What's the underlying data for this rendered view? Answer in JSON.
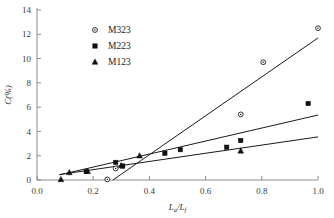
{
  "chart_data": {
    "type": "scatter",
    "title": "",
    "xlabel": "La/Lf",
    "xlabel_parts": {
      "base1": "L",
      "sub1": "a",
      "slash": "/",
      "base2": "L",
      "sub2": "f"
    },
    "ylabel": "C(%)",
    "xlim": [
      0.0,
      1.0
    ],
    "ylim": [
      0,
      14
    ],
    "xticks": [
      0.0,
      0.2,
      0.4,
      0.6,
      0.8,
      1.0
    ],
    "xtick_labels": [
      "0.0",
      "0.2",
      "0.4",
      "0.6",
      "0.8",
      "1.0"
    ],
    "yticks": [
      0,
      2,
      4,
      6,
      8,
      10,
      12,
      14
    ],
    "ytick_labels": [
      "0",
      "2",
      "4",
      "6",
      "8",
      "10",
      "12",
      "14"
    ],
    "grid": false,
    "legend_position": "upper-center-left",
    "series": [
      {
        "name": "M323",
        "marker": "open-circle",
        "color": "#111111",
        "points": [
          {
            "x": 0.25,
            "y": 0.05
          },
          {
            "x": 0.28,
            "y": 0.95
          },
          {
            "x": 0.725,
            "y": 5.4
          },
          {
            "x": 0.805,
            "y": 9.7
          },
          {
            "x": 1.0,
            "y": 12.5
          }
        ],
        "trendline": {
          "x1": 0.27,
          "y1": 0.0,
          "x2": 1.0,
          "y2": 11.7
        }
      },
      {
        "name": "M223",
        "marker": "filled-square",
        "color": "#111111",
        "points": [
          {
            "x": 0.175,
            "y": 0.7
          },
          {
            "x": 0.28,
            "y": 1.45
          },
          {
            "x": 0.305,
            "y": 1.15
          },
          {
            "x": 0.455,
            "y": 2.2
          },
          {
            "x": 0.51,
            "y": 2.5
          },
          {
            "x": 0.675,
            "y": 2.7
          },
          {
            "x": 0.725,
            "y": 3.25
          },
          {
            "x": 0.965,
            "y": 6.3
          }
        ],
        "trendline": {
          "x1": 0.08,
          "y1": 0.42,
          "x2": 1.0,
          "y2": 5.35
        }
      },
      {
        "name": "M123",
        "marker": "filled-triangle",
        "color": "#111111",
        "points": [
          {
            "x": 0.085,
            "y": 0.05
          },
          {
            "x": 0.115,
            "y": 0.62
          },
          {
            "x": 0.18,
            "y": 0.72
          },
          {
            "x": 0.3,
            "y": 1.2
          },
          {
            "x": 0.365,
            "y": 2.0
          },
          {
            "x": 0.725,
            "y": 2.4
          }
        ],
        "trendline": {
          "x1": 0.08,
          "y1": 0.45,
          "x2": 1.0,
          "y2": 3.55
        }
      }
    ]
  },
  "legend": {
    "entries": [
      {
        "label": "M323",
        "marker": "open-circle"
      },
      {
        "label": "M223",
        "marker": "filled-square"
      },
      {
        "label": "M123",
        "marker": "filled-triangle"
      }
    ]
  }
}
